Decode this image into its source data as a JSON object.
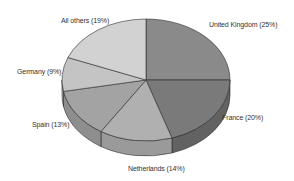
{
  "chart_data": {
    "type": "pie",
    "style": "3d",
    "title": "",
    "start_angle_deg": 90,
    "direction": "clockwise",
    "slices": [
      {
        "label": "United Kingdom",
        "value": 25,
        "display": "United Kingdom (25%)",
        "color": "#8a8a8a",
        "side_color": "#6e6e6e"
      },
      {
        "label": "France",
        "value": 20,
        "display": "France (20%)",
        "color": "#7a7a7a",
        "side_color": "#626262"
      },
      {
        "label": "Netherlands",
        "value": 14,
        "display": "Netherlands (14%)",
        "color": "#b0b0b0",
        "side_color": "#9a9a9a"
      },
      {
        "label": "Spain",
        "value": 13,
        "display": "Spain (13%)",
        "color": "#a3a3a3",
        "side_color": "#8e8e8e"
      },
      {
        "label": "Germany",
        "value": 9,
        "display": "Germany (9%)",
        "color": "#c4c4c4",
        "side_color": "#adadad"
      },
      {
        "label": "All others",
        "value": 19,
        "display": "All others (19%)",
        "color": "#d2d2d2",
        "side_color": "#bababa"
      }
    ],
    "legend": "none",
    "labels_position": "outside"
  },
  "geometry": {
    "cx": 146,
    "cy": 80,
    "rx": 84,
    "ry": 61,
    "depth": 15
  },
  "label_positions": [
    {
      "x": 209,
      "y": 21
    },
    {
      "x": 222,
      "y": 114
    },
    {
      "x": 128,
      "y": 165
    },
    {
      "x": 32,
      "y": 121
    },
    {
      "x": 17,
      "y": 68
    },
    {
      "x": 61,
      "y": 17
    }
  ]
}
